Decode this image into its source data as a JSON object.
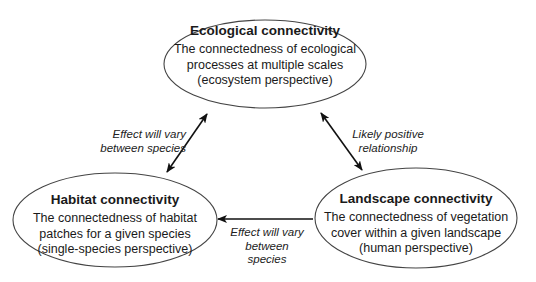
{
  "diagram": {
    "nodes": {
      "ecological": {
        "title": "Ecological connectivity",
        "description": "The connectedness of ecological\nprocesses at multiple scales\n(ecosystem perspective)"
      },
      "habitat": {
        "title": "Habitat connectivity",
        "description": "The connectedness of habitat\npatches for a given species\n(single-species perspective)"
      },
      "landscape": {
        "title": "Landscape connectivity",
        "description": "The connectedness of vegetation\ncover within a given landscape\n(human perspective)"
      }
    },
    "edges": {
      "ecological_habitat": {
        "label": "Effect will vary\nbetween species",
        "direction": "bidirectional"
      },
      "ecological_landscape": {
        "label": "Likely positive\nrelationship",
        "direction": "bidirectional"
      },
      "landscape_habitat": {
        "label": "Effect will vary\nbetween species",
        "direction": "landscape-to-habitat"
      }
    },
    "colors": {
      "stroke": "#333333",
      "arrow": "#111111",
      "background": "#ffffff"
    }
  }
}
